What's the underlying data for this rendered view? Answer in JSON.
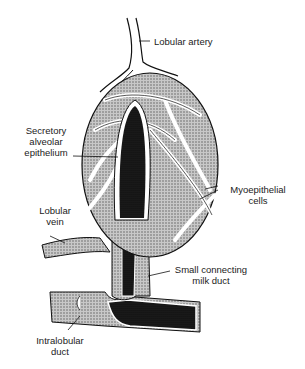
{
  "figure": {
    "labels": {
      "lobular_artery": "Lobular artery",
      "secretory_line1": "Secretory",
      "secretory_line2": "alveolar",
      "secretory_line3": "epithelium",
      "myo_line1": "Myoepithelial",
      "myo_line2": "cells",
      "vein_line1": "Lobular",
      "vein_line2": "vein",
      "milk_line1": "Small connecting",
      "milk_line2": "milk duct",
      "intra_line1": "Intralobular",
      "intra_line2": "duct"
    },
    "colors": {
      "ink": "#111111",
      "stipple": "#9a9a9a",
      "dark": "#0d0d0d",
      "background": "#ffffff"
    }
  }
}
